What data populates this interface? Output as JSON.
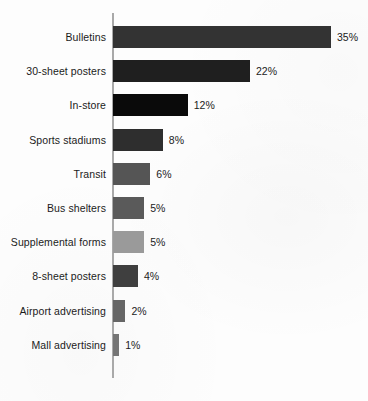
{
  "chart_data": {
    "type": "bar",
    "orientation": "horizontal",
    "title": "",
    "subtitle": "",
    "xlabel": "",
    "ylabel": "",
    "grid": false,
    "legend": null,
    "xlim": [
      0,
      35
    ],
    "categories": [
      "Bulletins",
      "30-sheet posters",
      "In-store",
      "Sports stadiums",
      "Transit",
      "Bus shelters",
      "Supplemental forms",
      "8-sheet posters",
      "Airport advertising",
      "Mall advertising"
    ],
    "values": [
      35,
      22,
      12,
      8,
      6,
      5,
      5,
      4,
      2,
      1
    ],
    "value_labels": [
      "35%",
      "22%",
      "12%",
      "8%",
      "6%",
      "5%",
      "5%",
      "4%",
      "2%",
      "1%"
    ],
    "bar_colors": [
      "#333333",
      "#1f1f1f",
      "#0a0a0a",
      "#2e2e2e",
      "#555555",
      "#5a5a5a",
      "#9a9a9a",
      "#3f3f3f",
      "#666666",
      "#757575"
    ],
    "axis_color": "#a9a9a9",
    "background_color": "#fdfdfd",
    "caption_fragment": ""
  }
}
